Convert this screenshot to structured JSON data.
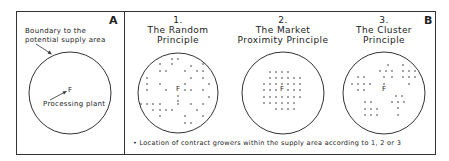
{
  "panel_a": {
    "letter": "A",
    "boundary_label_1": "Boundary to the",
    "boundary_label_2": "potential supply area",
    "plant_marker": "F",
    "plant_label": "Processing plant"
  },
  "panel_b": {
    "letter": "B",
    "principles": [
      {
        "number": "1.",
        "line1": "The Random",
        "line2": "Principle",
        "marker": "F"
      },
      {
        "number": "2.",
        "line1": "The Market",
        "line2": "Proximity Principle",
        "marker": "F"
      },
      {
        "number": "3.",
        "line1": "The Cluster",
        "line2": "Principle",
        "marker": "F"
      }
    ],
    "legend": "• Location of contract growers within the supply area according to 1, 2 or 3"
  },
  "colors": {
    "line": "#333333",
    "background": "#ffffff"
  }
}
